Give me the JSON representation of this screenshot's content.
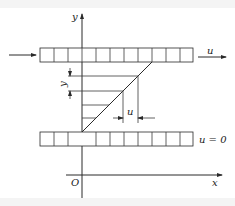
{
  "diagram": {
    "axes": {
      "y_label": "y",
      "x_label": "x",
      "origin_label": "O"
    },
    "top_plate": {
      "cells": 11,
      "velocity_label": "u"
    },
    "bottom_plate": {
      "cells": 11,
      "velocity_label": "u = 0"
    },
    "profile": {
      "y_dimension_label": "y",
      "u_dimension_label": "u",
      "hatch_lines": 4
    },
    "colors": {
      "line": "#2a2a2a",
      "background": "#ffffff"
    }
  }
}
